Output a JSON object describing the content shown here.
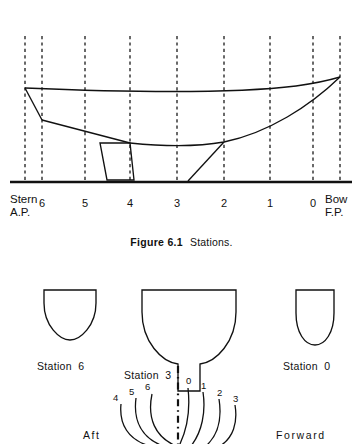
{
  "figure": {
    "caption_label": "Figure 6.1",
    "caption_text": "Stations.",
    "profile": {
      "left_end_line1": "Stern",
      "left_end_line2": "A.P.",
      "right_end_line1": "Bow",
      "right_end_line2": "F.P.",
      "station_labels": [
        "6",
        "5",
        "4",
        "3",
        "2",
        "1",
        "0"
      ]
    },
    "bodyplan": {
      "sections": [
        {
          "label": "Station  6"
        },
        {
          "label": "Station  3"
        },
        {
          "label": "Station  0"
        }
      ],
      "aft_curve_labels": [
        "4",
        "5",
        "6"
      ],
      "forward_curve_labels": [
        "0",
        "1",
        "2",
        "3"
      ],
      "aft_label": "Aft",
      "forward_label": "Forward"
    },
    "colors": {
      "ink": "#111111",
      "paper": "#ffffff"
    }
  }
}
